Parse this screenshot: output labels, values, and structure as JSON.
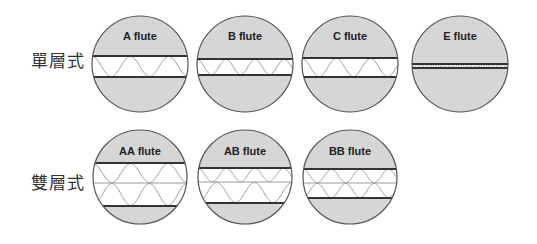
{
  "colors": {
    "fill": "#d6d6d6",
    "outline": "#555555",
    "liner": "#333333",
    "wave": "#9a9a9a",
    "core": "#ffffff",
    "label_text": "#333333"
  },
  "rows": [
    {
      "label": "單層式",
      "label_top": 51
    },
    {
      "label": "雙層式",
      "label_top": 173
    }
  ],
  "flutes": [
    {
      "name": "A flute",
      "cx": 140,
      "cy": 64,
      "r": 48,
      "title_y": 40,
      "liners": [
        56,
        77
      ],
      "layers": [
        {
          "top": 56,
          "bottom": 77,
          "waves": 2.5
        }
      ]
    },
    {
      "name": "B flute",
      "cx": 245,
      "cy": 64,
      "r": 48,
      "title_y": 40,
      "liners": [
        59,
        75
      ],
      "layers": [
        {
          "top": 59,
          "bottom": 75,
          "waves": 3.3
        }
      ]
    },
    {
      "name": "C flute",
      "cx": 350,
      "cy": 64,
      "r": 48,
      "title_y": 40,
      "liners": [
        58,
        77
      ],
      "layers": [
        {
          "top": 58,
          "bottom": 77,
          "waves": 2.8
        }
      ]
    },
    {
      "name": "E flute",
      "cx": 460,
      "cy": 64,
      "r": 48,
      "title_y": 40,
      "liners": [
        64,
        68
      ],
      "layers": [
        {
          "top": 64,
          "bottom": 68,
          "waves": 19
        }
      ]
    },
    {
      "name": "AA flute",
      "cx": 140,
      "cy": 177,
      "r": 47,
      "title_y": 155,
      "liners": [
        163,
        183,
        206
      ],
      "layers": [
        {
          "top": 163,
          "bottom": 183,
          "waves": 2.5
        },
        {
          "top": 183,
          "bottom": 206,
          "waves": 2.5,
          "invert": true
        }
      ]
    },
    {
      "name": "AB flute",
      "cx": 245,
      "cy": 177,
      "r": 47,
      "title_y": 155,
      "liners": [
        168,
        182,
        203
      ],
      "layers": [
        {
          "top": 168,
          "bottom": 182,
          "waves": 3.3
        },
        {
          "top": 182,
          "bottom": 203,
          "waves": 2.5,
          "invert": true
        }
      ]
    },
    {
      "name": "BB flute",
      "cx": 350,
      "cy": 177,
      "r": 47,
      "title_y": 155,
      "liners": [
        169,
        183,
        198
      ],
      "layers": [
        {
          "top": 169,
          "bottom": 183,
          "waves": 3.3
        },
        {
          "top": 183,
          "bottom": 198,
          "waves": 3.3,
          "invert": true
        }
      ]
    }
  ]
}
